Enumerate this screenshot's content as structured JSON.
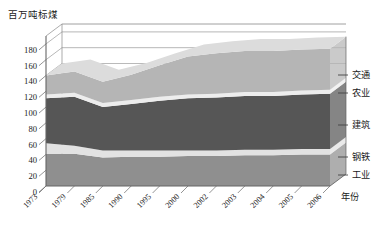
{
  "chart_data": {
    "type": "area",
    "title": "百万吨标煤",
    "xlabel": "年份",
    "ylabel": "百万吨标煤",
    "categories": [
      "1973",
      "1979",
      "1985",
      "1990",
      "1995",
      "2000",
      "2002",
      "2003",
      "2004",
      "2005",
      "2006"
    ],
    "ylim": [
      0,
      190
    ],
    "yticks": [
      0,
      20,
      40,
      60,
      80,
      100,
      120,
      140,
      160,
      180
    ],
    "grid": true,
    "legend_position": "right",
    "stacked": true,
    "series": [
      {
        "name": "工业",
        "color": "#8f8f8f",
        "values": [
          41,
          41,
          36,
          37,
          37,
          38,
          38,
          39,
          39,
          40,
          40
        ]
      },
      {
        "name": "钢铁",
        "color": "#e2e2e2",
        "values": [
          13,
          10,
          9,
          8,
          8,
          7,
          7,
          7,
          7,
          7,
          7
        ]
      },
      {
        "name": "建筑",
        "color": "#565656",
        "values": [
          57,
          62,
          55,
          59,
          63,
          66,
          67,
          68,
          68,
          69,
          70
        ]
      },
      {
        "name": "农业",
        "color": "#ededed",
        "values": [
          5,
          5,
          5,
          5,
          5,
          5,
          5,
          5,
          5,
          5,
          5
        ]
      },
      {
        "name": "交通",
        "color": "#b5b5b5",
        "values": [
          24,
          27,
          27,
          32,
          40,
          48,
          51,
          52,
          52,
          52,
          52
        ]
      }
    ],
    "totals": [
      140,
      145,
      132,
      141,
      153,
      164,
      168,
      171,
      171,
      173,
      174
    ],
    "annotations": []
  },
  "legend": {
    "items": [
      {
        "label": "交通"
      },
      {
        "label": "农业"
      },
      {
        "label": "建筑"
      },
      {
        "label": "钢铁"
      },
      {
        "label": "工业"
      }
    ],
    "axis_label": "年份"
  },
  "colors": {
    "transport": "#b5b5b5",
    "agriculture": "#ededed",
    "construction": "#565656",
    "steel": "#e2e2e2",
    "industry": "#8f8f8f",
    "axis": "#666666",
    "grid": "#888888",
    "text": "#1a1a1a",
    "side_face": "#6e6e6e"
  }
}
